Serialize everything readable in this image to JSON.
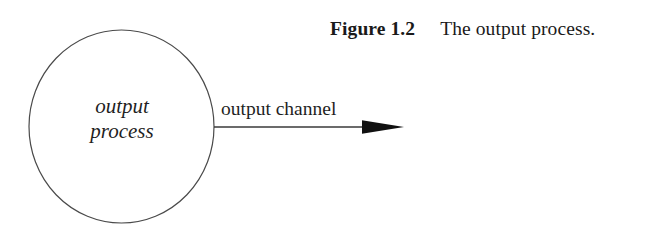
{
  "figure": {
    "caption_label": "Figure 1.2",
    "caption_text": "The output process.",
    "background_color": "#ffffff",
    "ink_color": "#1a1a1a",
    "stroke_color": "#4a4a4a"
  },
  "diagram": {
    "type": "dataflow",
    "nodes": [
      {
        "id": "output-process",
        "shape": "ellipse",
        "label_line_1": "output",
        "label_line_2": "process",
        "center_x": 121.5,
        "center_y": 126.5,
        "radius_x": 92.5,
        "radius_y": 96.5,
        "fill": "none",
        "stroke": "#4a4a4a",
        "stroke_width": 1.2
      }
    ],
    "edges": [
      {
        "id": "output-channel",
        "label": "output channel",
        "from": "output-process",
        "to": "environment",
        "x1": 214,
        "y1": 127,
        "x2": 404,
        "y2": 127,
        "arrowhead": "solid-triangle",
        "stroke": "#3a3a3a",
        "stroke_width": 1.4
      }
    ]
  }
}
